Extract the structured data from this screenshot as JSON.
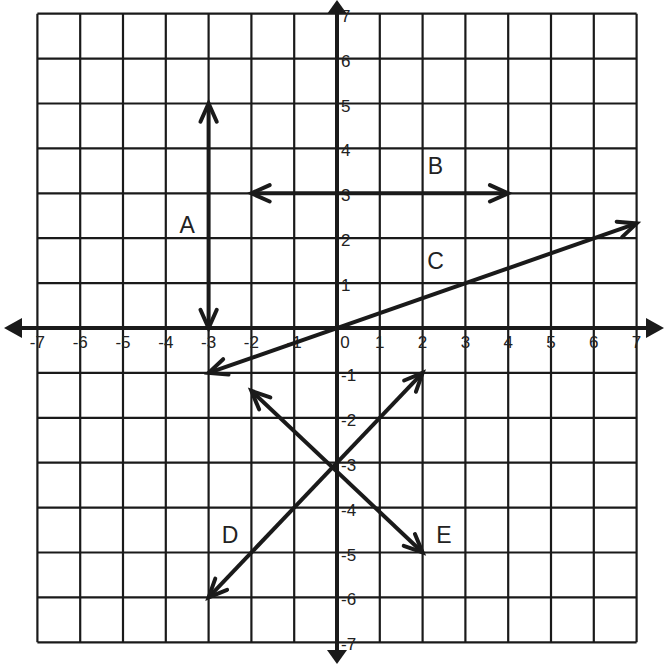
{
  "diagram": {
    "type": "coordinate-plane",
    "x_range": [
      -7,
      7
    ],
    "y_range": [
      -7,
      7
    ],
    "x_ticks": [
      "-7",
      "-6",
      "-5",
      "-4",
      "-3",
      "-2",
      "-1",
      "0",
      "1",
      "2",
      "3",
      "4",
      "5",
      "6",
      "7"
    ],
    "y_ticks": [
      "7",
      "6",
      "5",
      "4",
      "3",
      "2",
      "1",
      "-1",
      "-2",
      "-3",
      "-4",
      "-5",
      "-6",
      "-7"
    ],
    "colors": {
      "ink": "#1a1a1a",
      "background": "#ffffff"
    }
  },
  "lines": [
    {
      "label": "A",
      "from": [
        -3,
        0
      ],
      "to": [
        -3,
        5
      ],
      "arrows": "both",
      "label_pos": [
        -3.5,
        2.3
      ]
    },
    {
      "label": "B",
      "from": [
        -2,
        3
      ],
      "to": [
        4,
        3
      ],
      "arrows": "both",
      "label_pos": [
        2.3,
        3.6
      ]
    },
    {
      "label": "C",
      "from": [
        -3,
        -1
      ],
      "to": [
        7,
        2.33
      ],
      "arrows": "both",
      "label_pos": [
        2.3,
        1.5
      ]
    },
    {
      "label": "D",
      "from": [
        -3,
        -6
      ],
      "to": [
        2,
        -1
      ],
      "arrows": "both",
      "label_pos": [
        -2.5,
        -4.6
      ]
    },
    {
      "label": "E",
      "from": [
        -2,
        -1.4
      ],
      "to": [
        2,
        -5
      ],
      "arrows": "both",
      "label_pos": [
        2.5,
        -4.6
      ]
    }
  ]
}
